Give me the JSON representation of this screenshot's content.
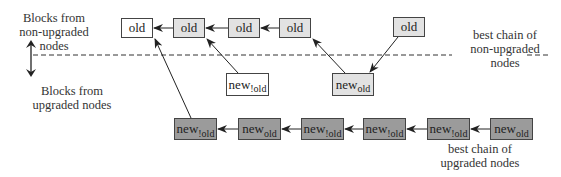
{
  "labels": {
    "non_upgraded_region": "Blocks from non-upgraded nodes",
    "non_upgraded_line1": "Blocks from",
    "non_upgraded_line2": "non-upgraded",
    "non_upgraded_line3": "nodes",
    "upgraded_region_line1": "Blocks from",
    "upgraded_region_line2": "upgraded nodes",
    "best_chain_non_upgraded_line1": "best chain of",
    "best_chain_non_upgraded_line2": "non-upgraded",
    "best_chain_non_upgraded_line3": "nodes",
    "best_chain_upgraded_line1": "best chain of",
    "best_chain_upgraded_line2": "upgraded nodes"
  },
  "top_chain": [
    {
      "label": "old",
      "style": "white"
    },
    {
      "label": "old",
      "style": "light"
    },
    {
      "label": "old",
      "style": "light"
    },
    {
      "label": "old",
      "style": "light"
    }
  ],
  "orphan_old": {
    "label": "old",
    "style": "light"
  },
  "middle_blocks": [
    {
      "main": "new",
      "sub": "!old",
      "style": "white"
    },
    {
      "main": "new",
      "sub": "old",
      "style": "light"
    }
  ],
  "bottom_chain": [
    {
      "main": "new",
      "sub": "!old"
    },
    {
      "main": "new",
      "sub": "old"
    },
    {
      "main": "new",
      "sub": "!old"
    },
    {
      "main": "new",
      "sub": "!old"
    },
    {
      "main": "new",
      "sub": "!old"
    },
    {
      "main": "new",
      "sub": "old"
    }
  ],
  "colors": {
    "white_block": "#ffffff",
    "light_block": "#e2e2e2",
    "dark_block": "#9b9b9b",
    "border": "#444444"
  }
}
